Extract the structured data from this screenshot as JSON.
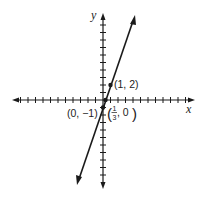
{
  "chart_data": {
    "type": "line",
    "title": "",
    "xlabel": "x",
    "ylabel": "y",
    "xlim": [
      -12,
      12
    ],
    "ylim": [
      -11,
      11
    ],
    "grid": false,
    "tick_spacing": 1,
    "series": [
      {
        "name": "y = 3x - 1",
        "slope": 3,
        "intercept": -1,
        "x": [
          -3.4,
          4.3
        ],
        "y": [
          -11.2,
          11.0
        ],
        "arrows": "both"
      }
    ],
    "points": [
      {
        "x": 1,
        "y": 2,
        "label": "(1, 2)"
      },
      {
        "x": 0,
        "y": -1,
        "label": "(0, −1)"
      },
      {
        "x": 0.3333,
        "y": 0,
        "label_num": "1",
        "label_den": "3",
        "label_rest": ", 0"
      }
    ]
  },
  "labels": {
    "x_axis": "x",
    "y_axis": "y",
    "point_1_2": "(1, 2)",
    "point_0_m1": "(0, −1)",
    "point_third_num": "1",
    "point_third_den": "3",
    "point_third_rest": ", 0"
  },
  "colors": {
    "ink": "#1a1a1a",
    "background": "#ffffff"
  }
}
